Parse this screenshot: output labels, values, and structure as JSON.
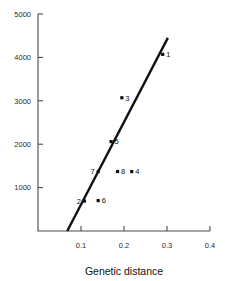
{
  "chart_data": {
    "type": "scatter",
    "title": "",
    "xlabel": "Genetic distance",
    "ylabel": "",
    "xlim": [
      0.0,
      0.4
    ],
    "ylim": [
      0,
      5000
    ],
    "grid": false,
    "legend": null,
    "x_ticks": [
      0.1,
      0.2,
      0.3,
      0.4
    ],
    "x_tick_labels": [
      "0.1",
      "0.2",
      "0.3",
      "0.4"
    ],
    "y_ticks": [
      1000,
      2000,
      3000,
      4000,
      5000
    ],
    "y_tick_labels": [
      "1000",
      "2000",
      "3000",
      "4000",
      "5000"
    ],
    "points": [
      {
        "label": "1",
        "x": 0.29,
        "y": 4070,
        "label_side": "right"
      },
      {
        "label": "2",
        "x": 0.108,
        "y": 690,
        "label_side": "left"
      },
      {
        "label": "3",
        "x": 0.195,
        "y": 3070,
        "label_side": "right"
      },
      {
        "label": "4",
        "x": 0.218,
        "y": 1370,
        "label_side": "right"
      },
      {
        "label": "5",
        "x": 0.17,
        "y": 2060,
        "label_side": "right"
      },
      {
        "label": "6",
        "x": 0.14,
        "y": 700,
        "label_side": "right"
      },
      {
        "label": "7",
        "x": 0.14,
        "y": 1370,
        "label_side": "left"
      },
      {
        "label": "8",
        "x": 0.185,
        "y": 1370,
        "label_side": "right"
      }
    ],
    "trendline": {
      "x_start": 0.068,
      "y_start": 0,
      "x_end": 0.302,
      "y_end": 4450
    },
    "colors": {
      "marker": "#111111",
      "line": "#111111",
      "axis": "#4a4a4a",
      "background": "#ffffff"
    }
  }
}
